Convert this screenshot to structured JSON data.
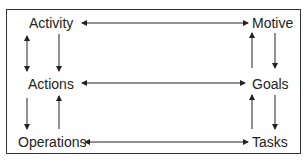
{
  "diagram": {
    "type": "activity-theory-hierarchy",
    "left_column": {
      "top": "Activity",
      "middle": "Actions",
      "bottom": "Operations"
    },
    "right_column": {
      "top": "Motive",
      "middle": "Goals",
      "bottom": "Tasks"
    },
    "edges": [
      {
        "from": "Activity",
        "to": "Motive",
        "type": "bidirectional"
      },
      {
        "from": "Actions",
        "to": "Goals",
        "type": "bidirectional"
      },
      {
        "from": "Operations",
        "to": "Tasks",
        "type": "bidirectional"
      },
      {
        "from": "Activity",
        "to": "Actions",
        "type": "bidirectional"
      },
      {
        "from": "Activity",
        "to": "Actions",
        "type": "directed"
      },
      {
        "from": "Actions",
        "to": "Operations",
        "type": "directed"
      },
      {
        "from": "Operations",
        "to": "Actions",
        "type": "directed"
      },
      {
        "from": "Motive",
        "to": "Goals",
        "type": "directed"
      },
      {
        "from": "Goals",
        "to": "Motive",
        "type": "directed"
      },
      {
        "from": "Goals",
        "to": "Tasks",
        "type": "directed"
      },
      {
        "from": "Tasks",
        "to": "Goals",
        "type": "directed"
      }
    ]
  }
}
